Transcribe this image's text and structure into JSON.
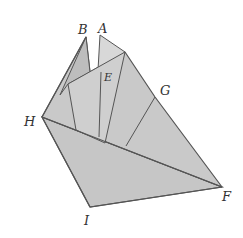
{
  "figure": {
    "labels": {
      "A": "A",
      "B": "B",
      "E": "E",
      "G": "G",
      "H": "H",
      "I": "I",
      "F": "F"
    },
    "colors": {
      "paper": "#c9c9c9",
      "paper_light": "#d4d4d4",
      "paper_dark": "#bdbdbd",
      "stroke": "#555555",
      "background": "#ffffff"
    }
  }
}
